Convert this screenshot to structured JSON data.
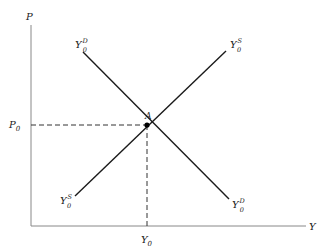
{
  "diagram": {
    "type": "supply-demand-equilibrium",
    "axes": {
      "y_axis_label": "P",
      "x_axis_label": "Y"
    },
    "equilibrium": {
      "point_label": "A",
      "price_label": "P",
      "price_sub": "0",
      "quantity_label": "Y",
      "quantity_sub": "0"
    },
    "curves": [
      {
        "name": "demand",
        "base": "Y",
        "sub": "0",
        "sup": "D",
        "direction": "downward-sloping"
      },
      {
        "name": "supply",
        "base": "Y",
        "sub": "0",
        "sup": "S",
        "direction": "upward-sloping"
      }
    ],
    "colors": {
      "line": "#1a1a1a",
      "axis": "#777777",
      "text": "#222222"
    }
  }
}
